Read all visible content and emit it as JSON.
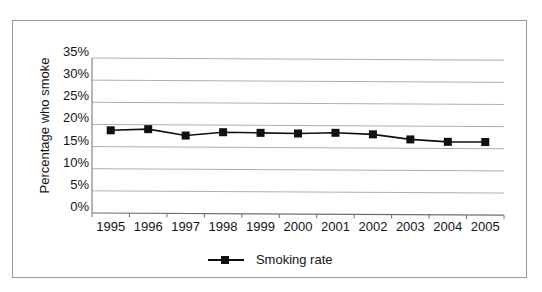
{
  "chart_data": {
    "type": "line",
    "title": "",
    "subtitle": "",
    "xlabel": "",
    "ylabel": "Percentage who smoke",
    "categories": [
      "1995",
      "1996",
      "1997",
      "1998",
      "1999",
      "2000",
      "2001",
      "2002",
      "2003",
      "2004",
      "2005"
    ],
    "series": [
      {
        "name": "Smoking rate",
        "values": [
          18.7,
          19.0,
          17.6,
          18.4,
          18.3,
          18.2,
          18.4,
          18.1,
          17.0,
          16.5,
          16.5
        ]
      }
    ],
    "ylim": [
      0,
      35
    ],
    "ytick_values": [
      0,
      5,
      10,
      15,
      20,
      25,
      30,
      35
    ],
    "ytick_labels": [
      "0%",
      "5%",
      "10%",
      "15%",
      "20%",
      "25%",
      "30%",
      "35%"
    ],
    "grid": "horizontal",
    "legend_position": "bottom-center",
    "marker": "square",
    "colors": {
      "series_line": "#101010",
      "marker": "#101010",
      "gridline": "#b0b0b0",
      "axis": "#6e6e6e",
      "text": "#141414",
      "frame": "#999999",
      "background": "#ffffff"
    }
  },
  "legend": {
    "entries": [
      {
        "label": "Smoking rate",
        "marker": "square-marker-icon"
      }
    ]
  }
}
